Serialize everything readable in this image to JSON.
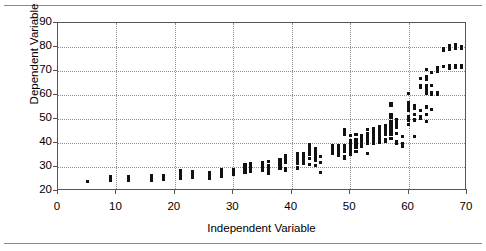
{
  "figure": {
    "background": "#ffffff",
    "point_color": "#111111",
    "grid_color": "#8d8d8d",
    "frame_color": "#555555",
    "rule_color": "#8a8a8a",
    "rule_top_label": "top-divider-rule",
    "rule_bottom_label": "bottom-divider-rule"
  },
  "chart_data": {
    "type": "scatter",
    "title": "",
    "xlabel": "Independent Variable",
    "ylabel": "Dependent Variable",
    "xlim": [
      0,
      70
    ],
    "ylim": [
      20,
      90
    ],
    "xticks": [
      0,
      10,
      20,
      30,
      40,
      50,
      60,
      70
    ],
    "yticks": [
      20,
      30,
      40,
      50,
      60,
      70,
      80,
      90
    ],
    "grid": true,
    "legend": null,
    "marker": "square",
    "marker_color": "#111111",
    "points": [
      [
        5,
        24
      ],
      [
        9,
        24.4
      ],
      [
        9,
        25.2
      ],
      [
        9,
        25.9
      ],
      [
        12,
        24.6
      ],
      [
        12,
        25.3
      ],
      [
        12,
        26.1
      ],
      [
        16,
        24.2
      ],
      [
        16,
        24.9
      ],
      [
        16,
        25.6
      ],
      [
        16,
        26.3
      ],
      [
        18,
        25.0
      ],
      [
        18,
        25.7
      ],
      [
        18,
        26.4
      ],
      [
        21,
        25.4
      ],
      [
        21,
        26.2
      ],
      [
        21,
        27.0
      ],
      [
        21,
        27.8
      ],
      [
        21,
        28.6
      ],
      [
        23,
        25.6
      ],
      [
        23,
        26.4
      ],
      [
        23,
        27.2
      ],
      [
        23,
        28.0
      ],
      [
        26,
        25.4
      ],
      [
        26,
        26.2
      ],
      [
        26,
        27.0
      ],
      [
        26,
        27.8
      ],
      [
        28,
        26.0
      ],
      [
        28,
        26.8
      ],
      [
        28,
        27.6
      ],
      [
        28,
        28.4
      ],
      [
        28,
        29.0
      ],
      [
        30,
        26.7
      ],
      [
        30,
        27.5
      ],
      [
        30,
        28.3
      ],
      [
        30,
        29.0
      ],
      [
        32,
        27.8
      ],
      [
        32,
        28.6
      ],
      [
        32,
        29.4
      ],
      [
        32,
        30.2
      ],
      [
        32,
        31.0
      ],
      [
        33,
        28.2
      ],
      [
        33,
        29.0
      ],
      [
        33,
        29.8
      ],
      [
        33,
        30.6
      ],
      [
        33,
        31.4
      ],
      [
        35,
        28.6
      ],
      [
        35,
        29.4
      ],
      [
        35,
        30.2
      ],
      [
        35,
        31.0
      ],
      [
        35,
        31.8
      ],
      [
        36,
        27.4
      ],
      [
        36,
        28.2
      ],
      [
        36,
        29.0
      ],
      [
        36,
        29.8
      ],
      [
        36,
        30.6
      ],
      [
        36,
        32.4
      ],
      [
        38,
        29.3
      ],
      [
        38,
        30.1
      ],
      [
        38,
        30.9
      ],
      [
        38,
        31.7
      ],
      [
        38,
        32.5
      ],
      [
        38,
        33.3
      ],
      [
        39,
        28.4
      ],
      [
        39,
        29.2
      ],
      [
        39,
        31.8
      ],
      [
        39,
        33.0
      ],
      [
        39,
        33.8
      ],
      [
        39,
        34.8
      ],
      [
        41,
        29.6
      ],
      [
        41,
        31.5
      ],
      [
        41,
        32.6
      ],
      [
        41,
        33.4
      ],
      [
        41,
        34.2
      ],
      [
        41,
        35.0
      ],
      [
        41,
        35.8
      ],
      [
        42,
        31.4
      ],
      [
        42,
        32.2
      ],
      [
        42,
        33.0
      ],
      [
        42,
        33.8
      ],
      [
        42,
        34.6
      ],
      [
        42,
        35.4
      ],
      [
        43,
        31.0
      ],
      [
        43,
        33.6
      ],
      [
        43,
        35.4
      ],
      [
        43,
        36.2
      ],
      [
        43,
        37.0
      ],
      [
        43,
        38.0
      ],
      [
        43,
        39.4
      ],
      [
        44,
        30.8
      ],
      [
        44,
        32.6
      ],
      [
        44,
        33.6
      ],
      [
        44,
        34.4
      ],
      [
        44,
        35.2
      ],
      [
        44,
        36.0
      ],
      [
        44,
        36.8
      ],
      [
        44,
        37.6
      ],
      [
        45,
        27.8
      ],
      [
        45,
        31.8
      ],
      [
        45,
        34.4
      ],
      [
        47,
        35.8
      ],
      [
        47,
        36.6
      ],
      [
        47,
        37.4
      ],
      [
        47,
        38.2
      ],
      [
        47,
        38.9
      ],
      [
        48,
        35.0
      ],
      [
        48,
        36.4
      ],
      [
        48,
        37.2
      ],
      [
        48,
        38.0
      ],
      [
        48,
        38.8
      ],
      [
        49,
        33.6
      ],
      [
        49,
        34.4
      ],
      [
        49,
        36.6
      ],
      [
        49,
        37.4
      ],
      [
        49,
        38.2
      ],
      [
        49,
        39.0
      ],
      [
        49,
        43.6
      ],
      [
        49,
        44.8
      ],
      [
        49,
        45.4
      ],
      [
        50,
        35.4
      ],
      [
        50,
        37.0
      ],
      [
        50,
        37.8
      ],
      [
        50,
        38.6
      ],
      [
        50,
        39.4
      ],
      [
        50,
        40.2
      ],
      [
        50,
        41.0
      ],
      [
        50,
        43.0
      ],
      [
        51,
        36.6
      ],
      [
        51,
        38.2
      ],
      [
        51,
        39.0
      ],
      [
        51,
        39.8
      ],
      [
        51,
        40.6
      ],
      [
        51,
        41.4
      ],
      [
        51,
        43.6
      ],
      [
        52,
        38.4
      ],
      [
        52,
        39.2
      ],
      [
        52,
        40.0
      ],
      [
        52,
        40.8
      ],
      [
        52,
        41.6
      ],
      [
        52,
        42.4
      ],
      [
        52,
        43.2
      ],
      [
        53,
        35.8
      ],
      [
        53,
        39.8
      ],
      [
        53,
        40.6
      ],
      [
        53,
        41.4
      ],
      [
        53,
        42.2
      ],
      [
        53,
        43.0
      ],
      [
        53,
        43.8
      ],
      [
        53,
        45.6
      ],
      [
        54,
        40.0
      ],
      [
        54,
        40.8
      ],
      [
        54,
        41.6
      ],
      [
        54,
        42.4
      ],
      [
        54,
        43.2
      ],
      [
        54,
        44.0
      ],
      [
        54,
        44.8
      ],
      [
        54,
        46.0
      ],
      [
        55,
        40.4
      ],
      [
        55,
        41.2
      ],
      [
        55,
        42.0
      ],
      [
        55,
        42.8
      ],
      [
        55,
        43.6
      ],
      [
        55,
        44.4
      ],
      [
        55,
        45.2
      ],
      [
        55,
        46.0
      ],
      [
        55,
        46.8
      ],
      [
        56,
        40.6
      ],
      [
        56,
        41.4
      ],
      [
        56,
        43.4
      ],
      [
        56,
        44.2
      ],
      [
        56,
        45.0
      ],
      [
        56,
        45.8
      ],
      [
        56,
        46.6
      ],
      [
        56,
        47.4
      ],
      [
        57,
        41.8
      ],
      [
        57,
        43.4
      ],
      [
        57,
        44.2
      ],
      [
        57,
        45.0
      ],
      [
        57,
        45.8
      ],
      [
        57,
        46.6
      ],
      [
        57,
        47.4
      ],
      [
        57,
        48.2
      ],
      [
        57,
        49.0
      ],
      [
        57,
        50.6
      ],
      [
        57,
        51.8
      ],
      [
        58,
        39.8
      ],
      [
        58,
        40.6
      ],
      [
        58,
        44.0
      ],
      [
        58,
        46.4
      ],
      [
        58,
        47.2
      ],
      [
        58,
        48.0
      ],
      [
        58,
        48.8
      ],
      [
        58,
        49.6
      ],
      [
        57,
        55.6
      ],
      [
        57,
        56.6
      ],
      [
        59,
        38.6
      ],
      [
        59,
        39.8
      ],
      [
        59,
        42.8
      ],
      [
        60,
        47.6
      ],
      [
        60,
        49.4
      ],
      [
        60,
        50.2
      ],
      [
        60,
        51.0
      ],
      [
        60,
        53.4
      ],
      [
        60,
        54.4
      ],
      [
        60,
        55.4
      ],
      [
        60,
        56.2
      ],
      [
        60,
        57.0
      ],
      [
        60,
        60.8
      ],
      [
        61,
        42.6
      ],
      [
        61,
        49.6
      ],
      [
        61,
        52.0
      ],
      [
        61,
        54.6
      ],
      [
        61,
        55.4
      ],
      [
        62,
        50.4
      ],
      [
        62,
        51.2
      ],
      [
        62,
        53.6
      ],
      [
        62,
        63.0
      ],
      [
        62,
        64.0
      ],
      [
        62,
        67.0
      ],
      [
        63,
        48.8
      ],
      [
        63,
        52.0
      ],
      [
        63,
        55.0
      ],
      [
        63,
        60.6
      ],
      [
        63,
        61.4
      ],
      [
        63,
        62.2
      ],
      [
        63,
        63.0
      ],
      [
        63,
        63.8
      ],
      [
        63,
        66.4
      ],
      [
        63,
        67.6
      ],
      [
        63,
        70.6
      ],
      [
        64,
        54.0
      ],
      [
        64,
        60.2
      ],
      [
        64,
        61.0
      ],
      [
        64,
        64.0
      ],
      [
        64,
        69.4
      ],
      [
        65,
        60.4
      ],
      [
        65,
        61.2
      ],
      [
        65,
        70.0
      ],
      [
        65,
        71.6
      ],
      [
        66,
        72.0
      ],
      [
        66,
        78.6
      ],
      [
        66,
        79.2
      ],
      [
        67,
        71.2
      ],
      [
        67,
        72.4
      ],
      [
        67,
        78.8
      ],
      [
        67,
        79.6
      ],
      [
        67,
        80.4
      ],
      [
        68,
        71.6
      ],
      [
        68,
        72.4
      ],
      [
        68,
        79.2
      ],
      [
        68,
        80.0
      ],
      [
        68,
        81.0
      ],
      [
        69,
        71.4
      ],
      [
        69,
        72.2
      ],
      [
        69,
        79.4
      ],
      [
        69,
        80.2
      ]
    ]
  }
}
